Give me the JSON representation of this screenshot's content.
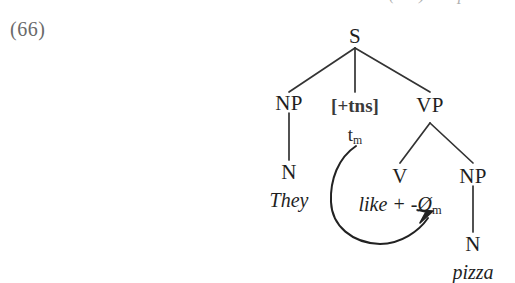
{
  "figure": {
    "clipped_previous_line": "(one) like pizza.",
    "example_number": "(66)"
  },
  "tree": {
    "nodes": {
      "s": "S",
      "np_subject": "NP",
      "tns": "[+tns]",
      "trace_t": "t",
      "trace_sub": "m",
      "vp": "VP",
      "n_subject": "N",
      "they": "They",
      "v": "V",
      "like_stem": "like + -Ø",
      "like_sub": "m",
      "np_object": "NP",
      "n_object": "N",
      "pizza": "pizza"
    }
  },
  "colors": {
    "background": "#ffffff",
    "ink": "#1f1f1f",
    "muted_ink": "#6a6a6a",
    "line": "#333333"
  }
}
